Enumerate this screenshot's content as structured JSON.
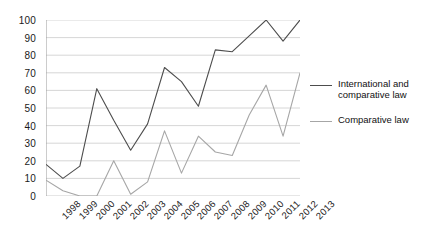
{
  "chart_data": {
    "type": "line",
    "title": "",
    "subtitle": "",
    "xlabel": "",
    "ylabel": "",
    "categories": [
      "1998",
      "1999",
      "2000",
      "2001",
      "2002",
      "2003",
      "2004",
      "2005",
      "2006",
      "2007",
      "2008",
      "2009",
      "2010",
      "2011",
      "2012",
      "2013"
    ],
    "x": [
      "1998",
      "1999",
      "2000",
      "2001",
      "2002",
      "2003",
      "2004",
      "2005",
      "2006",
      "2007",
      "2008",
      "2009",
      "2010",
      "2011",
      "2012",
      "2013"
    ],
    "series": [
      {
        "name": "International and comparative law",
        "color": "#4d4d4d",
        "values": [
          18,
          10,
          17,
          61,
          43,
          26,
          41,
          73,
          65,
          51,
          83,
          82,
          91,
          100,
          88,
          100
        ]
      },
      {
        "name": "Comparative law",
        "color": "#a6a6a6",
        "values": [
          9,
          3,
          0,
          0,
          20,
          1,
          8,
          37,
          13,
          34,
          25,
          23,
          46,
          63,
          34,
          70
        ]
      }
    ],
    "ylim": [
      0,
      100
    ],
    "yticks": [
      0,
      10,
      20,
      30,
      40,
      50,
      60,
      70,
      80,
      90,
      100
    ],
    "ytick_labels": [
      "0",
      "10",
      "20",
      "30",
      "40",
      "50",
      "60",
      "70",
      "80",
      "90",
      "100"
    ],
    "grid": "horizontal",
    "grid_color": "#cccccc",
    "legend_position": "right",
    "axis_color": "#999999",
    "background": "#ffffff"
  },
  "legend": {
    "entries": [
      {
        "label": "International and comparative law"
      },
      {
        "label": "Comparative law"
      }
    ]
  }
}
